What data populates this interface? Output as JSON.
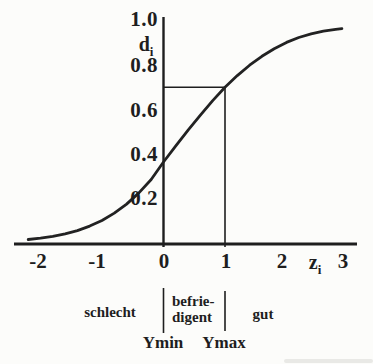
{
  "chart_data": {
    "type": "line",
    "title": "",
    "ylabel": "d",
    "ylabel_sub": "i",
    "xlabel": "z",
    "xlabel_sub": "i",
    "y_ticks": [
      {
        "value": 1.0,
        "label": "1.0"
      },
      {
        "value": 0.8,
        "label": "0.8"
      },
      {
        "value": 0.6,
        "label": "0.6"
      },
      {
        "value": 0.4,
        "label": "0.4"
      },
      {
        "value": 0.2,
        "label": "0.2"
      }
    ],
    "x_ticks": [
      {
        "value": -2,
        "label": "-2"
      },
      {
        "value": -1,
        "label": "-1"
      },
      {
        "value": 0,
        "label": "0"
      },
      {
        "value": 1,
        "label": "1"
      },
      {
        "value": 2,
        "label": "2"
      },
      {
        "value": 3,
        "label": "3"
      }
    ],
    "xlim": [
      -2.4,
      3.15
    ],
    "ylim": [
      0,
      1.05
    ],
    "grid": false,
    "legend": "none",
    "series": [
      {
        "name": "desirability-curve",
        "points": [
          [
            -2.2,
            0.02
          ],
          [
            -2.0,
            0.026
          ],
          [
            -1.8,
            0.034
          ],
          [
            -1.6,
            0.045
          ],
          [
            -1.4,
            0.06
          ],
          [
            -1.2,
            0.08
          ],
          [
            -1.0,
            0.105
          ],
          [
            -0.8,
            0.138
          ],
          [
            -0.6,
            0.178
          ],
          [
            -0.4,
            0.228
          ],
          [
            -0.2,
            0.288
          ],
          [
            0.0,
            0.366
          ],
          [
            0.2,
            0.438
          ],
          [
            0.4,
            0.508
          ],
          [
            0.6,
            0.575
          ],
          [
            0.8,
            0.64
          ],
          [
            1.0,
            0.7
          ],
          [
            1.2,
            0.752
          ],
          [
            1.4,
            0.798
          ],
          [
            1.6,
            0.838
          ],
          [
            1.8,
            0.872
          ],
          [
            2.0,
            0.9
          ],
          [
            2.2,
            0.922
          ],
          [
            2.4,
            0.938
          ],
          [
            2.6,
            0.95
          ],
          [
            2.8,
            0.958
          ],
          [
            2.9,
            0.961
          ]
        ]
      }
    ],
    "reference": {
      "hline": {
        "d": 0.7,
        "z_from": 0,
        "z_to": 1
      },
      "vline": {
        "z": 1,
        "d_from": 0,
        "d_to": 0.7
      }
    },
    "zones": [
      {
        "label": "schlecht",
        "range": "z < 0"
      },
      {
        "label_line1": "befrie-",
        "label_line2": "digent",
        "range": "0 < z < 1"
      },
      {
        "label": "gut",
        "range": "z > 1"
      }
    ],
    "zone_boundaries": [
      {
        "label": "Ymin",
        "z": 0
      },
      {
        "label": "Ymax",
        "z": 1
      }
    ]
  },
  "colors": {
    "ink": "#1e1e1e",
    "background": "#fcfcfa"
  }
}
